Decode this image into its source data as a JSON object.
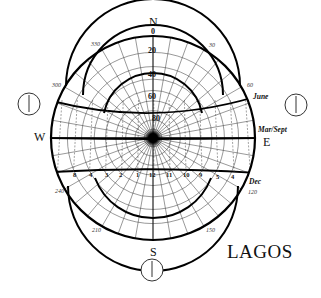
{
  "diagram": {
    "type": "sun-path-stereographic",
    "city": "LAGOS",
    "compass": {
      "north": "N",
      "south": "S",
      "east": "E",
      "west": "W"
    },
    "altitude_labels": [
      "0",
      "20",
      "40",
      "60",
      "80"
    ],
    "azimuth_labels": [
      "330",
      "30",
      "300",
      "60",
      "240",
      "120",
      "210",
      "150"
    ],
    "sun_paths": [
      {
        "name": "June"
      },
      {
        "name": "Mar/Sept"
      },
      {
        "name": "Dec"
      }
    ],
    "hour_labels": [
      "8",
      "4",
      "3",
      "2",
      "1",
      "12",
      "11",
      "10",
      "9",
      "5",
      "4"
    ],
    "clocks": [
      {
        "position": "west",
        "name": "morning-clock"
      },
      {
        "position": "east",
        "name": "afternoon-clock"
      },
      {
        "position": "south",
        "name": "noon-clock"
      }
    ]
  }
}
